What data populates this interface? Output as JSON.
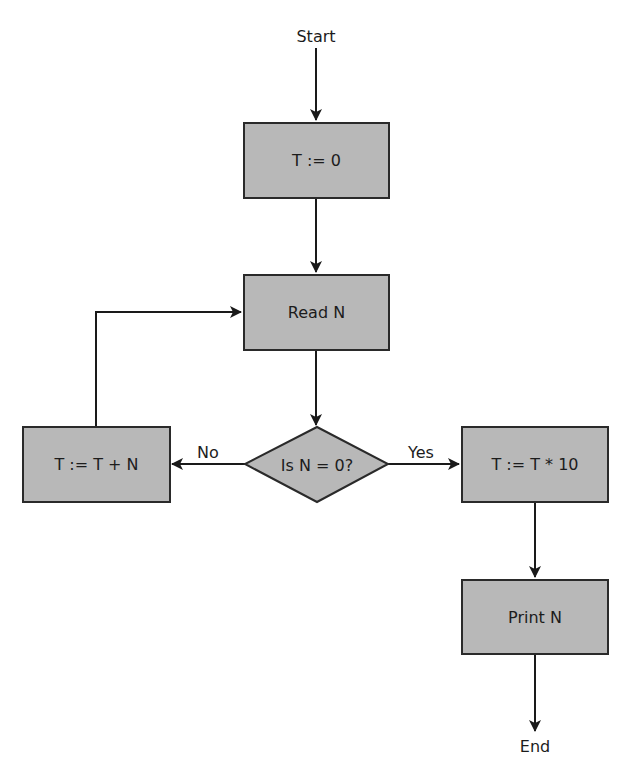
{
  "diagram": {
    "type": "flowchart",
    "colors": {
      "node_fill": "#b8b8b8",
      "stroke": "#2a2a2a",
      "text": "#1c1c1c",
      "background": "#ffffff"
    },
    "terminals": {
      "start": "Start",
      "end": "End"
    },
    "nodes": {
      "init": {
        "label": "T := 0",
        "shape": "process"
      },
      "read": {
        "label": "Read N",
        "shape": "process"
      },
      "decision": {
        "label": "Is N = 0?",
        "shape": "decision"
      },
      "add": {
        "label": "T := T + N",
        "shape": "process"
      },
      "multiply": {
        "label": "T := T * 10",
        "shape": "process"
      },
      "print": {
        "label": "Print N",
        "shape": "process"
      }
    },
    "edge_labels": {
      "no": "No",
      "yes": "Yes"
    },
    "edges": [
      {
        "from": "Start",
        "to": "T := 0"
      },
      {
        "from": "T := 0",
        "to": "Read N"
      },
      {
        "from": "Read N",
        "to": "Is N = 0?"
      },
      {
        "from": "Is N = 0?",
        "to": "T := T + N",
        "label": "No"
      },
      {
        "from": "Is N = 0?",
        "to": "T := T * 10",
        "label": "Yes"
      },
      {
        "from": "T := T + N",
        "to": "Read N"
      },
      {
        "from": "T := T * 10",
        "to": "Print N"
      },
      {
        "from": "Print N",
        "to": "End"
      }
    ]
  }
}
